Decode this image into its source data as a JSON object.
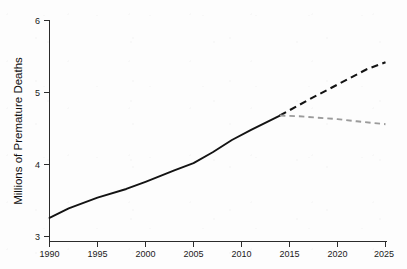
{
  "chart_data": {
    "type": "line",
    "title": "",
    "subtitle": "",
    "xlabel": "",
    "ylabel": "Millions of Premature Deaths",
    "xlim": [
      1990,
      2025
    ],
    "ylim": [
      3,
      6
    ],
    "x_ticks": [
      1990,
      1995,
      2000,
      2005,
      2010,
      2015,
      2020,
      2025
    ],
    "x_tick_labels": [
      "1990",
      "1995",
      "2000",
      "2005",
      "2010",
      "2015",
      "2020",
      "2025"
    ],
    "y_ticks": [
      3,
      4,
      5,
      6
    ],
    "y_tick_labels": [
      "3",
      "4",
      "5",
      "6"
    ],
    "grid": false,
    "legend": "none",
    "annotations": [],
    "series": [
      {
        "name": "Historical",
        "style": "solid",
        "color": "#131313",
        "x": [
          1990,
          1992,
          1995,
          1998,
          2000,
          2003,
          2005,
          2007,
          2009,
          2011,
          2014
        ],
        "values": [
          3.26,
          3.39,
          3.54,
          3.66,
          3.76,
          3.92,
          4.02,
          4.17,
          4.34,
          4.48,
          4.68
        ]
      },
      {
        "name": "Projection High",
        "style": "dashed",
        "color": "#131313",
        "x": [
          2014,
          2017,
          2020,
          2023,
          2025
        ],
        "values": [
          4.68,
          4.9,
          5.11,
          5.32,
          5.42
        ]
      },
      {
        "name": "Projection Low",
        "style": "dashed",
        "color": "#9b9b9b",
        "x": [
          2014,
          2016,
          2018,
          2020,
          2022,
          2025
        ],
        "values": [
          4.68,
          4.67,
          4.65,
          4.63,
          4.6,
          4.56
        ]
      }
    ]
  },
  "axes": {
    "y_axis_title": "Millions of Premature Deaths",
    "x_axis_title": ""
  }
}
